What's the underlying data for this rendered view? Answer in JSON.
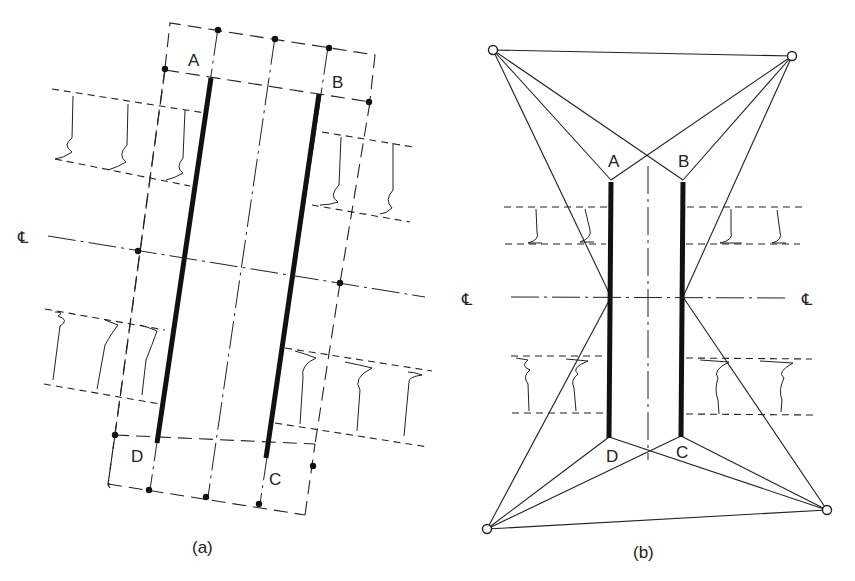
{
  "figure": {
    "panels": [
      {
        "id": "a",
        "caption": "(a)",
        "corner_labels": {
          "A": "A",
          "B": "B",
          "C": "C",
          "D": "D"
        },
        "centerline_label": "℄"
      },
      {
        "id": "b",
        "caption": "(b)",
        "corner_labels": {
          "A": "A",
          "B": "B",
          "C": "C",
          "D": "D"
        },
        "centerline_label_left": "℄",
        "centerline_label_right": "℄"
      }
    ]
  },
  "colors": {
    "ink": "#222222",
    "background": "#ffffff"
  }
}
